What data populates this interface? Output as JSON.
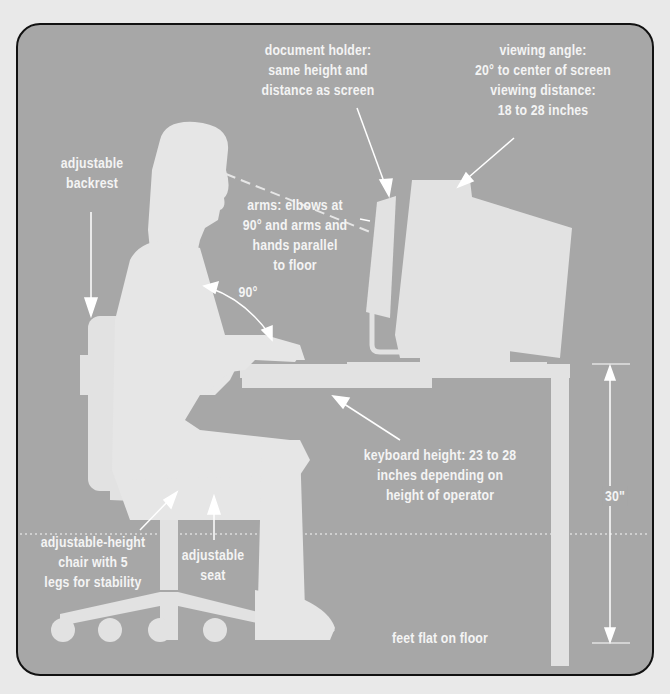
{
  "diagram": {
    "colors": {
      "page_background": "#e9e9e9",
      "panel_background": "#a7a7a7",
      "panel_border": "#111111",
      "silhouette": "#e4e4e4",
      "text": "#f4f4f4"
    },
    "labels": {
      "document_holder": {
        "lines": [
          "document holder:",
          "same height and",
          "distance as screen"
        ]
      },
      "viewing": {
        "lines": [
          "viewing angle:",
          "20° to center of screen",
          "viewing distance:",
          "18 to 28 inches"
        ]
      },
      "backrest": {
        "lines": [
          "adjustable",
          "backrest"
        ]
      },
      "arms": {
        "lines": [
          "arms: elbows at",
          "90° and arms and",
          "hands parallel",
          "to floor"
        ]
      },
      "elbow_angle": {
        "lines": [
          "90°"
        ]
      },
      "keyboard_height": {
        "lines": [
          "keyboard height: 23 to 28",
          "inches depending on",
          "height of operator"
        ]
      },
      "desk_height": {
        "lines": [
          "30\""
        ]
      },
      "chair": {
        "lines": [
          "adjustable-height",
          "chair with 5",
          "legs for stability"
        ]
      },
      "seat": {
        "lines": [
          "adjustable",
          "seat"
        ]
      },
      "feet": {
        "lines": [
          "feet flat on floor"
        ]
      }
    }
  }
}
